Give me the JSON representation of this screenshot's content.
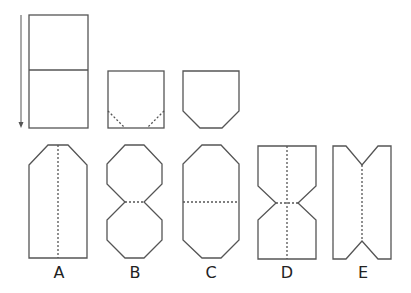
{
  "diagram": {
    "stroke_color": "#555555",
    "steps": [
      {
        "name": "unfolded-rectangle",
        "description": "Rectangle folded in half along horizontal middle line, arrow showing fold downward"
      },
      {
        "name": "folded-square",
        "description": "Folded square with dashed diagonal corner cut lines"
      },
      {
        "name": "cut-square",
        "description": "Square with bottom corners cut off"
      }
    ],
    "options": [
      {
        "label": "A"
      },
      {
        "label": "B"
      },
      {
        "label": "C"
      },
      {
        "label": "D"
      },
      {
        "label": "E"
      }
    ]
  }
}
